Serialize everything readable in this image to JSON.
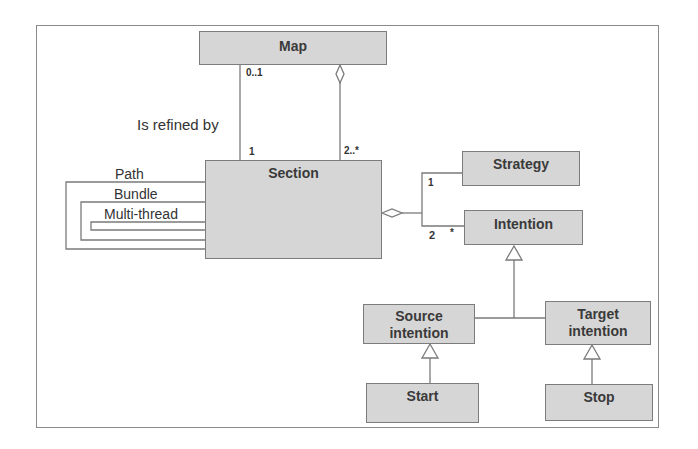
{
  "diagram": {
    "type": "UML class diagram",
    "classes": {
      "map": "Map",
      "section": "Section",
      "strategy": "Strategy",
      "intention": "Intention",
      "source_intention": [
        "Source",
        "intention"
      ],
      "target_intention": [
        "Target",
        "intention"
      ],
      "start": "Start",
      "stop": "Stop"
    },
    "labels": {
      "is_refined_by": "Is refined by",
      "path": "Path",
      "bundle": "Bundle",
      "multi_thread": "Multi-thread"
    },
    "multiplicities": {
      "map_refine": "0..1",
      "section_refine": "1",
      "section_aggregate": "2..*",
      "strategy": "1",
      "intention": "2",
      "intention_star": "*"
    },
    "relationships": [
      {
        "from": "Map",
        "to": "Section",
        "kind": "association",
        "label": "Is refined by",
        "from_mult": "0..1",
        "to_mult": "1"
      },
      {
        "from": "Map",
        "to": "Section",
        "kind": "aggregation",
        "to_mult": "2..*"
      },
      {
        "from": "Section",
        "to": "Strategy",
        "kind": "aggregation",
        "to_mult": "1"
      },
      {
        "from": "Section",
        "to": "Intention",
        "kind": "aggregation",
        "to_mult": "2 *"
      },
      {
        "from": "Source intention",
        "to": "Intention",
        "kind": "generalization"
      },
      {
        "from": "Target intention",
        "to": "Intention",
        "kind": "generalization"
      },
      {
        "from": "Start",
        "to": "Source intention",
        "kind": "generalization"
      },
      {
        "from": "Stop",
        "to": "Target intention",
        "kind": "generalization"
      }
    ],
    "colors": {
      "box_fill": "#d6d6d6",
      "box_border": "#7c7c7c",
      "line": "#7a7a7a",
      "text": "#333333"
    }
  }
}
